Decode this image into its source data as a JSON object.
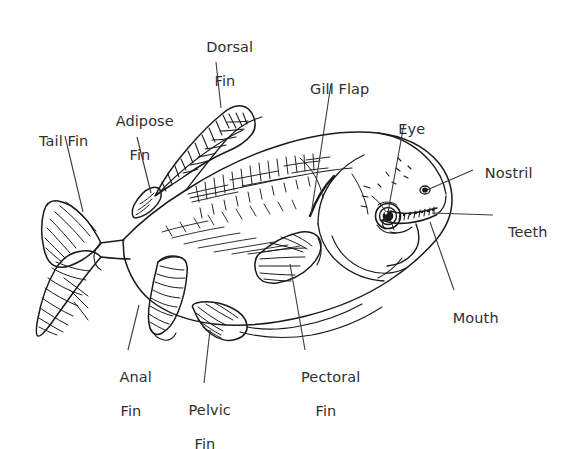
{
  "diagram": {
    "style": "black-and-white line drawing",
    "background_color": "#ffffff",
    "ink_color": "#1a1a1a",
    "text_color": "#2f2f2f",
    "leader_line_color": "#3a3a3a",
    "font_size_px": 14.5
  },
  "labels": [
    {
      "id": "dorsal-fin",
      "line1": "Dorsal",
      "line2": "Fin",
      "x": 186,
      "y": 22,
      "width": 78,
      "leader": {
        "x1": 216,
        "y1": 62,
        "x2": 221,
        "y2": 108
      }
    },
    {
      "id": "gill-flap",
      "line1": "Gill Flap",
      "line2": "",
      "x": 291,
      "y": 64,
      "width": 88,
      "leader": {
        "x1": 331,
        "y1": 84,
        "x2": 311,
        "y2": 215
      }
    },
    {
      "id": "eye",
      "line1": "Eye",
      "line2": "",
      "x": 385,
      "y": 104,
      "width": 44,
      "leader": {
        "x1": 404,
        "y1": 124,
        "x2": 388,
        "y2": 212
      }
    },
    {
      "id": "adipose-fin",
      "line1": "Adipose",
      "line2": "Fin",
      "x": 99,
      "y": 96,
      "width": 82,
      "leader": {
        "x1": 137,
        "y1": 137,
        "x2": 151,
        "y2": 193
      }
    },
    {
      "id": "tail-fin",
      "line1": "Tail Fin",
      "line2": "",
      "x": 24,
      "y": 116,
      "width": 70,
      "leader": {
        "x1": 65,
        "y1": 136,
        "x2": 83,
        "y2": 212
      }
    },
    {
      "id": "nostril",
      "line1": "Nostril",
      "line2": "",
      "x": 473,
      "y": 148,
      "width": 62,
      "leader": {
        "x1": 473,
        "y1": 170,
        "x2": 427,
        "y2": 190
      }
    },
    {
      "id": "teeth",
      "line1": "Teeth",
      "line2": "",
      "x": 496,
      "y": 207,
      "width": 54,
      "leader": {
        "x1": 493,
        "y1": 215,
        "x2": 432,
        "y2": 213
      }
    },
    {
      "id": "mouth",
      "line1": "Mouth",
      "line2": "",
      "x": 440,
      "y": 293,
      "width": 62,
      "leader": {
        "x1": 454,
        "y1": 290,
        "x2": 430,
        "y2": 222
      }
    },
    {
      "id": "pectoral-fin",
      "line1": "Pectoral",
      "line2": "Fin",
      "x": 286,
      "y": 352,
      "width": 80,
      "leader": {
        "x1": 305,
        "y1": 350,
        "x2": 290,
        "y2": 264
      }
    },
    {
      "id": "pelvic-fin",
      "line1": "Pelvic",
      "line2": "Fin",
      "x": 172,
      "y": 385,
      "width": 66,
      "leader": {
        "x1": 204,
        "y1": 383,
        "x2": 210,
        "y2": 330
      }
    },
    {
      "id": "anal-fin",
      "line1": "Anal",
      "line2": "Fin",
      "x": 101,
      "y": 352,
      "width": 60,
      "leader": {
        "x1": 128,
        "y1": 350,
        "x2": 139,
        "y2": 305
      }
    }
  ]
}
